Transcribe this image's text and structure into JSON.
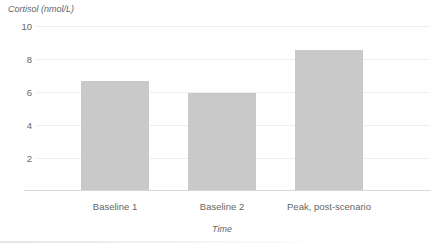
{
  "chart_data": {
    "type": "bar",
    "title": "",
    "ylabel": "Cortisol (nmol/L)",
    "xlabel": "Time",
    "categories": [
      "Baseline 1",
      "Baseline 2",
      "Peak, post-scenario"
    ],
    "values": [
      6.6,
      5.9,
      8.5
    ],
    "ylim": [
      0,
      10
    ],
    "yticks": [
      2,
      4,
      6,
      8,
      10
    ],
    "grid": true,
    "legend_position": "none",
    "colors": {
      "bar": "#c9c9c9",
      "gridline": "#efefef",
      "axis_line": "#d9d9d9",
      "text": "#666666",
      "background": "#ffffff"
    }
  }
}
